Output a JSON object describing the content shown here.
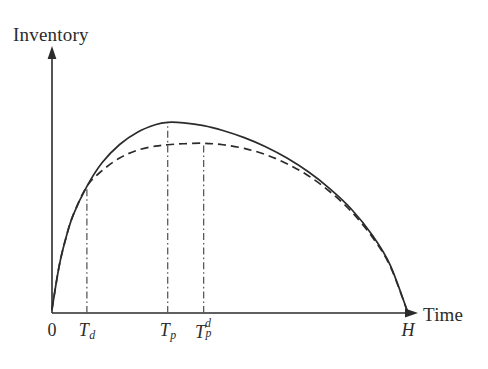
{
  "figure": {
    "background_color": "#ffffff",
    "ink_color": "#2b2b2b",
    "width": 488,
    "height": 369
  },
  "axes": {
    "y_axis_label": "Inventory",
    "x_axis_label": "Time",
    "origin_label": "0",
    "y_axis_arrow": "arrow-up-icon",
    "x_axis_arrow": "arrow-right-icon"
  },
  "chart_data": {
    "type": "line",
    "title": "",
    "xlabel": "Time",
    "ylabel": "Inventory",
    "grid": false,
    "legend_position": "none",
    "xlim": [
      0,
      1
    ],
    "ylim": [
      0,
      1
    ],
    "x_tick_labels": [
      "0",
      "T_d",
      "T_p",
      "T_p^d",
      "H"
    ],
    "x_tick_positions": [
      0.0,
      0.098,
      0.325,
      0.426,
      1.0
    ],
    "annotations": [
      "Solid and dashed curves coincide from 0 to T_d",
      "Solid curve peaks at T_p",
      "Dashed curve peaks at T_p^d, lower than solid peak",
      "Both curves return to zero inventory at H"
    ],
    "vertical_reference_lines": [
      {
        "name": "T_d",
        "x": 0.098,
        "style": "dash-dot",
        "top_curve": "shared"
      },
      {
        "name": "T_p",
        "x": 0.325,
        "style": "dash-dot",
        "top_curve": "solid"
      },
      {
        "name": "T_p^d",
        "x": 0.426,
        "style": "dash-dot",
        "top_curve": "dashed"
      }
    ],
    "series": [
      {
        "name": "inventory-solid",
        "style": "solid",
        "color": "#2b2b2b",
        "x": [
          0.0,
          0.02,
          0.04,
          0.06,
          0.098,
          0.14,
          0.19,
          0.24,
          0.29,
          0.325,
          0.37,
          0.426,
          0.48,
          0.54,
          0.6,
          0.66,
          0.72,
          0.78,
          0.84,
          0.9,
          0.95,
          1.0
        ],
        "values": [
          0.015,
          0.19,
          0.31,
          0.4,
          0.515,
          0.61,
          0.685,
          0.735,
          0.765,
          0.775,
          0.773,
          0.762,
          0.742,
          0.713,
          0.676,
          0.63,
          0.574,
          0.506,
          0.424,
          0.316,
          0.195,
          0.0
        ]
      },
      {
        "name": "inventory-dashed",
        "style": "dashed",
        "color": "#2b2b2b",
        "x": [
          0.0,
          0.02,
          0.04,
          0.06,
          0.098,
          0.14,
          0.19,
          0.24,
          0.29,
          0.325,
          0.37,
          0.426,
          0.48,
          0.54,
          0.6,
          0.66,
          0.72,
          0.78,
          0.84,
          0.9,
          0.95,
          1.0
        ],
        "values": [
          0.015,
          0.19,
          0.31,
          0.4,
          0.515,
          0.578,
          0.63,
          0.662,
          0.678,
          0.684,
          0.688,
          0.69,
          0.684,
          0.669,
          0.644,
          0.607,
          0.558,
          0.494,
          0.414,
          0.308,
          0.19,
          0.0
        ]
      }
    ]
  },
  "tick_labels": {
    "zero": {
      "text": "0"
    },
    "td": {
      "base": "T",
      "sub": "d"
    },
    "tp": {
      "base": "T",
      "sub": "p"
    },
    "tpd": {
      "base": "T",
      "sub": "p",
      "sup": "d"
    },
    "h": {
      "text": "H"
    }
  }
}
